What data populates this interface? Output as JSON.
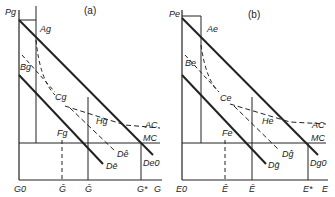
{
  "panels": [
    {
      "id": "a",
      "title": "(a)",
      "y_axis": "Pg",
      "points": {
        "A": "Ag",
        "B": "Bg",
        "C": "Cg",
        "F": "Fg",
        "H": "Hg"
      },
      "curves": {
        "AC": "AC",
        "MC": "MC",
        "D_hat": "Dê",
        "D_bar": "Dē",
        "D_0": "De0"
      },
      "x_ticks": [
        "G0",
        "Ĝ",
        "Ḡ",
        "G*"
      ],
      "x_axis": "G"
    },
    {
      "id": "b",
      "title": "(b)",
      "y_axis": "Pe",
      "points": {
        "A": "Ae",
        "B": "Be",
        "C": "Ce",
        "F": "Fe",
        "H": "He"
      },
      "curves": {
        "AC": "AC",
        "MC": "MC",
        "D_hat": "Dĝ",
        "D_bar": "Dḡ",
        "D_0": "Dg0"
      },
      "x_ticks": [
        "E0",
        "Ê",
        "Ē",
        "E*"
      ],
      "x_axis": "E"
    }
  ]
}
